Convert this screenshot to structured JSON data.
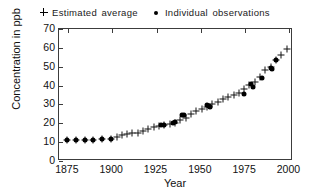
{
  "chart_data": {
    "type": "scatter",
    "title": "",
    "xlabel": "Year",
    "ylabel": "Concentration in ppb",
    "xlim": [
      1870,
      2002
    ],
    "ylim": [
      0,
      70
    ],
    "xticks": [
      1875,
      1900,
      1925,
      1950,
      1975,
      2000
    ],
    "yticks": [
      0,
      10,
      20,
      30,
      40,
      50,
      60,
      70
    ],
    "grid": false,
    "legend_position": "top-center",
    "series": [
      {
        "name": "Estimated average",
        "marker": "plus",
        "color": "#111111",
        "points": [
          [
            1875,
            10.5
          ],
          [
            1880,
            10.6
          ],
          [
            1885,
            10.7
          ],
          [
            1890,
            10.8
          ],
          [
            1895,
            11.0
          ],
          [
            1900,
            11.3
          ],
          [
            1903,
            12.2
          ],
          [
            1906,
            13.0
          ],
          [
            1909,
            13.6
          ],
          [
            1912,
            14.2
          ],
          [
            1915,
            14.5
          ],
          [
            1918,
            15.3
          ],
          [
            1921,
            16.4
          ],
          [
            1924,
            17.5
          ],
          [
            1927,
            18.2
          ],
          [
            1930,
            18.6
          ],
          [
            1933,
            19.1
          ],
          [
            1936,
            19.8
          ],
          [
            1939,
            21.0
          ],
          [
            1942,
            22.3
          ],
          [
            1945,
            24.3
          ],
          [
            1948,
            25.8
          ],
          [
            1951,
            27.0
          ],
          [
            1954,
            28.1
          ],
          [
            1957,
            29.8
          ],
          [
            1960,
            30.8
          ],
          [
            1963,
            32.3
          ],
          [
            1966,
            33.6
          ],
          [
            1969,
            34.4
          ],
          [
            1972,
            35.3
          ],
          [
            1975,
            37.6
          ],
          [
            1978,
            39.6
          ],
          [
            1981,
            41.6
          ],
          [
            1984,
            44.2
          ],
          [
            1987,
            47.5
          ],
          [
            1990,
            49.4
          ],
          [
            1993,
            52.8
          ],
          [
            1996,
            55.5
          ],
          [
            1999,
            58.8
          ]
        ]
      },
      {
        "name": "Individual observations",
        "marker": "dot",
        "color": "#000000",
        "points": [
          [
            1875,
            10.8
          ],
          [
            1880,
            10.4
          ],
          [
            1885,
            10.8
          ],
          [
            1890,
            10.4
          ],
          [
            1895,
            11.0
          ],
          [
            1900,
            11.2
          ],
          [
            1928,
            18.3
          ],
          [
            1930,
            18.7
          ],
          [
            1935,
            19.4
          ],
          [
            1936,
            19.9
          ],
          [
            1940,
            23.8
          ],
          [
            1941,
            23.9
          ],
          [
            1954,
            29.4
          ],
          [
            1955,
            28.5
          ],
          [
            1955.5,
            27.9
          ],
          [
            1975,
            34.8
          ],
          [
            1979,
            40.2
          ],
          [
            1980,
            38.5
          ],
          [
            1985,
            43.6
          ],
          [
            1990,
            48.6
          ],
          [
            1990.5,
            48.2
          ],
          [
            1993,
            52.8
          ]
        ]
      }
    ]
  },
  "legend": {
    "entries": [
      {
        "label": "Estimated average",
        "marker": "plus"
      },
      {
        "label": "Individual observations",
        "marker": "dot"
      }
    ]
  }
}
